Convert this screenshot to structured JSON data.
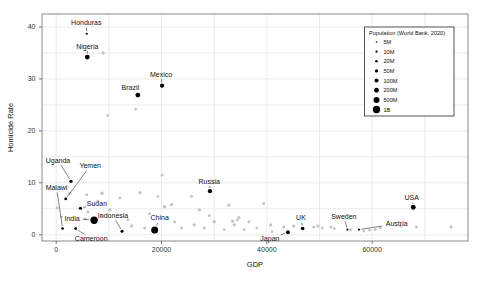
{
  "figure": {
    "width": 477,
    "height": 283,
    "background": "#ffffff"
  },
  "chart_data": {
    "type": "scatter",
    "title": "",
    "xlabel": "GDP",
    "ylabel": "Homicide Rate",
    "xlim": [
      -2700,
      78200
    ],
    "ylim": [
      -1.2,
      42.5
    ],
    "x_ticks": [
      0,
      20000,
      40000,
      60000
    ],
    "x_tick_labels": [
      "0",
      "20000",
      "40000",
      "60000"
    ],
    "x_grid_step": 10000,
    "x_grid_max": 70000,
    "y_ticks": [
      0,
      10,
      20,
      30,
      40
    ],
    "y_grid_step": 5,
    "y_grid_max": 40,
    "grid": true,
    "legend": {
      "title": "Population (World Bank, 2020)",
      "position": "top-right",
      "entries": [
        {
          "label": "5M",
          "size": 1.6
        },
        {
          "label": "10M",
          "size": 2.1
        },
        {
          "label": "20M",
          "size": 2.6
        },
        {
          "label": "50M",
          "size": 3.2
        },
        {
          "label": "100M",
          "size": 4.0
        },
        {
          "label": "200M",
          "size": 4.8
        },
        {
          "label": "500M",
          "size": 6.0
        },
        {
          "label": "1B",
          "size": 7.4
        }
      ]
    },
    "labeled_points": [
      {
        "name": "Honduras",
        "gdp": 5800,
        "rate": 38.7,
        "size": 2.2,
        "label_dx": -0.5,
        "label_dy": -11,
        "leader": true
      },
      {
        "name": "Nigeria",
        "gdp": 5900,
        "rate": 34.2,
        "size": 4.8,
        "label_dx": 0,
        "label_dy": -11,
        "leader": true
      },
      {
        "name": "Brazil",
        "gdp": 15500,
        "rate": 26.9,
        "size": 4.8,
        "label_dx": -7.5,
        "label_dy": -7.5,
        "leader": false
      },
      {
        "name": "Mexico",
        "gdp": 20100,
        "rate": 28.7,
        "size": 4.2,
        "label_dx": -1,
        "label_dy": -11.5,
        "leader": true
      },
      {
        "name": "Uganda",
        "gdp": 2800,
        "rate": 10.3,
        "size": 3.2,
        "label_dx": -13,
        "label_dy": -21,
        "leader": true
      },
      {
        "name": "Yemen",
        "gdp": 1800,
        "rate": 6.9,
        "size": 2.8,
        "label_dx": 24.5,
        "label_dy": -33,
        "leader": true
      },
      {
        "name": "Malawi",
        "gdp": 1200,
        "rate": 1.2,
        "size": 2.6,
        "label_dx": -6,
        "label_dy": -41,
        "leader": true
      },
      {
        "name": "Sudan",
        "gdp": 4600,
        "rate": 5.1,
        "size": 3.2,
        "label_dx": 16.5,
        "label_dy": -4.5,
        "leader": true
      },
      {
        "name": "India",
        "gdp": 7200,
        "rate": 2.8,
        "size": 7.4,
        "label_dx": -22,
        "label_dy": -2,
        "leader": true
      },
      {
        "name": "Cameroon",
        "gdp": 3700,
        "rate": 1.2,
        "size": 2.8,
        "label_dx": 15.5,
        "label_dy": 10.5,
        "leader": true
      },
      {
        "name": "Indonesia",
        "gdp": 12500,
        "rate": 0.7,
        "size": 3.0,
        "label_dx": -9,
        "label_dy": -15.5,
        "leader": true
      },
      {
        "name": "China",
        "gdp": 18700,
        "rate": 0.9,
        "size": 7.0,
        "label_dx": 5,
        "label_dy": -12,
        "leader": true
      },
      {
        "name": "Russia",
        "gdp": 29200,
        "rate": 8.4,
        "size": 4.2,
        "label_dx": -0.7,
        "label_dy": -10,
        "leader": true
      },
      {
        "name": "Japan",
        "gdp": 44000,
        "rate": 0.5,
        "size": 4.0,
        "label_dx": -18,
        "label_dy": 6.5,
        "leader": true
      },
      {
        "name": "UK",
        "gdp": 46800,
        "rate": 1.2,
        "size": 3.6,
        "label_dx": -1.7,
        "label_dy": -10.7,
        "leader": true
      },
      {
        "name": "Sweden",
        "gdp": 55300,
        "rate": 1.0,
        "size": 2.2,
        "label_dx": -3.6,
        "label_dy": -13.2,
        "leader": true
      },
      {
        "name": "Austria",
        "gdp": 57500,
        "rate": 1.0,
        "size": 2.2,
        "label_dx": 37.7,
        "label_dy": -5.7,
        "leader": true
      },
      {
        "name": "USA",
        "gdp": 67800,
        "rate": 5.3,
        "size": 4.8,
        "label_dx": -1.6,
        "label_dy": -9.4,
        "leader": true
      }
    ],
    "background_points": [
      [
        8900,
        35.0,
        1.6
      ],
      [
        15100,
        24.2,
        1.5
      ],
      [
        9800,
        23.0,
        1.4
      ],
      [
        20100,
        11.5,
        1.5
      ],
      [
        39400,
        6.0,
        1.5
      ],
      [
        5800,
        7.7,
        1.5
      ],
      [
        8700,
        8.0,
        1.8
      ],
      [
        15900,
        8.1,
        1.6
      ],
      [
        20600,
        5.4,
        1.8
      ],
      [
        21900,
        5.8,
        1.6
      ],
      [
        25700,
        7.4,
        1.5
      ],
      [
        27200,
        4.8,
        1.6
      ],
      [
        29100,
        3.7,
        1.5
      ],
      [
        22500,
        2.5,
        1.6
      ],
      [
        23800,
        1.3,
        1.4
      ],
      [
        26200,
        1.9,
        1.6
      ],
      [
        28100,
        1.3,
        1.5
      ],
      [
        30000,
        2.5,
        1.7
      ],
      [
        31900,
        1.0,
        1.4
      ],
      [
        33800,
        1.9,
        1.6
      ],
      [
        34700,
        3.3,
        1.5
      ],
      [
        36600,
        2.5,
        1.6
      ],
      [
        38100,
        1.3,
        1.4
      ],
      [
        14300,
        1.7,
        1.6
      ],
      [
        13600,
        2.9,
        1.5
      ],
      [
        16800,
        1.3,
        1.5
      ],
      [
        10200,
        4.8,
        1.6
      ],
      [
        7900,
        6.5,
        1.5
      ],
      [
        6000,
        4.4,
        1.5
      ],
      [
        2600,
        8.0,
        1.6
      ],
      [
        190,
        5.2,
        1.4
      ],
      [
        1000,
        3.4,
        1.4
      ],
      [
        8700,
        3.6,
        1.6
      ],
      [
        5500,
        3.1,
        1.5
      ],
      [
        33500,
        2.6,
        1.7
      ],
      [
        34400,
        2.9,
        1.5
      ],
      [
        35700,
        1.0,
        1.4
      ],
      [
        40700,
        1.9,
        1.6
      ],
      [
        41000,
        0.6,
        1.3
      ],
      [
        43200,
        1.5,
        1.5
      ],
      [
        45100,
        1.7,
        1.6
      ],
      [
        48900,
        1.5,
        1.5
      ],
      [
        49700,
        1.7,
        1.6
      ],
      [
        50500,
        1.3,
        1.4
      ],
      [
        52200,
        1.5,
        1.5
      ],
      [
        52800,
        1.2,
        1.4
      ],
      [
        55900,
        1.0,
        1.4
      ],
      [
        58400,
        0.7,
        1.3
      ],
      [
        59500,
        0.9,
        1.4
      ],
      [
        60600,
        1.0,
        1.5
      ],
      [
        61500,
        1.3,
        1.5
      ],
      [
        65500,
        1.7,
        1.6
      ],
      [
        68400,
        1.5,
        1.5
      ],
      [
        75000,
        1.5,
        1.6
      ],
      [
        32800,
        5.7,
        1.6
      ],
      [
        19300,
        7.4,
        1.4
      ],
      [
        12100,
        7.1,
        1.4
      ],
      [
        17700,
        4.1,
        1.5
      ]
    ]
  },
  "colors": {
    "point": "#000000",
    "background_point": "#c4c4c4",
    "grid": "#e2e2e2",
    "axis_border": "#8a8a8a",
    "leader": "#333333",
    "text": "#111111",
    "tick_text": "#333333",
    "legend_border": "#444444",
    "legend_bg": "#ffffff"
  }
}
